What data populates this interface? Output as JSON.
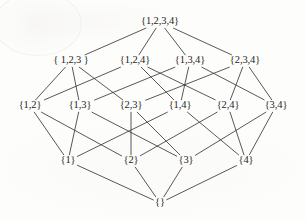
{
  "figure": {
    "type": "lattice-diagram",
    "width": 306,
    "height": 220,
    "background_color": "#fdfdfc",
    "edge_color": "#3b3a38",
    "label_color": "#262523"
  },
  "nodes": [
    {
      "id": "full",
      "label": "{1,2,3,4}",
      "rank": 4,
      "x": 160,
      "y": 22
    },
    {
      "id": "123",
      "label": "{ 1,2,3 }",
      "rank": 3,
      "x": 71,
      "y": 61
    },
    {
      "id": "124",
      "label": "{1,2,4}",
      "rank": 3,
      "x": 135,
      "y": 61
    },
    {
      "id": "134",
      "label": "{1,3,4}",
      "rank": 3,
      "x": 190,
      "y": 61
    },
    {
      "id": "234",
      "label": "{2,3,4}",
      "rank": 3,
      "x": 245,
      "y": 61
    },
    {
      "id": "12",
      "label": "{1,2}",
      "rank": 2,
      "x": 30,
      "y": 106
    },
    {
      "id": "13",
      "label": "{1,3}",
      "rank": 2,
      "x": 80,
      "y": 106
    },
    {
      "id": "23",
      "label": "{2,3}",
      "rank": 2,
      "x": 131,
      "y": 106
    },
    {
      "id": "14",
      "label": "{1,4}",
      "rank": 2,
      "x": 180,
      "y": 106
    },
    {
      "id": "24",
      "label": "{2,4}",
      "rank": 2,
      "x": 228,
      "y": 106
    },
    {
      "id": "34",
      "label": "{3,4}",
      "rank": 2,
      "x": 276,
      "y": 106
    },
    {
      "id": "1",
      "label": "{1}",
      "rank": 1,
      "x": 68,
      "y": 161
    },
    {
      "id": "2",
      "label": "{2}",
      "rank": 1,
      "x": 131,
      "y": 161
    },
    {
      "id": "3",
      "label": "{3}",
      "rank": 1,
      "x": 186,
      "y": 161
    },
    {
      "id": "4",
      "label": "{4}",
      "rank": 1,
      "x": 246,
      "y": 161
    },
    {
      "id": "empty",
      "label": "{}",
      "rank": 0,
      "x": 160,
      "y": 203
    }
  ],
  "edges": [
    {
      "from": "full",
      "to": "123"
    },
    {
      "from": "full",
      "to": "124"
    },
    {
      "from": "full",
      "to": "134"
    },
    {
      "from": "full",
      "to": "234"
    },
    {
      "from": "123",
      "to": "12"
    },
    {
      "from": "123",
      "to": "13"
    },
    {
      "from": "123",
      "to": "23"
    },
    {
      "from": "124",
      "to": "12"
    },
    {
      "from": "124",
      "to": "14"
    },
    {
      "from": "124",
      "to": "24"
    },
    {
      "from": "134",
      "to": "13"
    },
    {
      "from": "134",
      "to": "14"
    },
    {
      "from": "134",
      "to": "34"
    },
    {
      "from": "234",
      "to": "23"
    },
    {
      "from": "234",
      "to": "24"
    },
    {
      "from": "234",
      "to": "34"
    },
    {
      "from": "12",
      "to": "1"
    },
    {
      "from": "12",
      "to": "2"
    },
    {
      "from": "13",
      "to": "1"
    },
    {
      "from": "13",
      "to": "3"
    },
    {
      "from": "23",
      "to": "2"
    },
    {
      "from": "23",
      "to": "3"
    },
    {
      "from": "14",
      "to": "1"
    },
    {
      "from": "14",
      "to": "4"
    },
    {
      "from": "24",
      "to": "2"
    },
    {
      "from": "24",
      "to": "4"
    },
    {
      "from": "34",
      "to": "3"
    },
    {
      "from": "34",
      "to": "4"
    },
    {
      "from": "1",
      "to": "empty"
    },
    {
      "from": "2",
      "to": "empty"
    },
    {
      "from": "3",
      "to": "empty"
    },
    {
      "from": "4",
      "to": "empty"
    }
  ]
}
